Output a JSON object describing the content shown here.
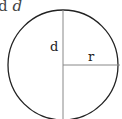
{
  "header": {
    "clipped_prefix": "d",
    "variable": "d"
  },
  "diagram": {
    "shape": "circle",
    "labels": {
      "diameter": "d",
      "radius": "r"
    },
    "colors": {
      "circle_stroke": "#222222",
      "line_stroke": "#888888",
      "label": "#222222"
    }
  }
}
